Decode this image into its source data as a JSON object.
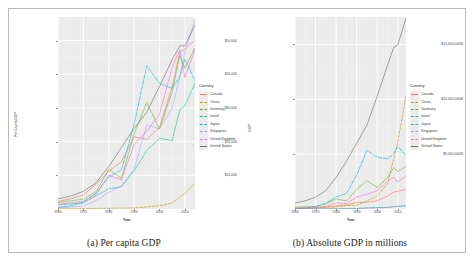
{
  "figure": {
    "panels": [
      {
        "id": "a",
        "caption": "(a) Per capita GDP",
        "ylabel": "PerCapitaGDP",
        "xlabel": "Year",
        "legend_title": "Country"
      },
      {
        "id": "b",
        "caption": "(b) Absolute GDP in millions",
        "ylabel": "GDP",
        "xlabel": "Year",
        "legend_title": "Country"
      }
    ]
  },
  "countries": [
    {
      "name": "Canada",
      "color": "#F8766D"
    },
    {
      "name": "China",
      "color": "#C49A00"
    },
    {
      "name": "Germany",
      "color": "#53B400"
    },
    {
      "name": "Israel",
      "color": "#00C094"
    },
    {
      "name": "Japan",
      "color": "#00B6EB"
    },
    {
      "name": "Singapore",
      "color": "#A58AFF"
    },
    {
      "name": "United Kingdom",
      "color": "#FB61D7"
    },
    {
      "name": "United States",
      "color": "#6E6E6E"
    }
  ],
  "chart_data": [
    {
      "type": "line",
      "panel": "a",
      "title": "(a) Per capita GDP",
      "xlabel": "Year",
      "ylabel": "PerCapitaGDP",
      "xlim": [
        1960,
        2014
      ],
      "ylim": [
        0,
        57000
      ],
      "xticks": [
        1960,
        1970,
        1980,
        1990,
        2000,
        2010
      ],
      "xticklabels": [
        "1960",
        "1970",
        "1980",
        "1990",
        "2000",
        "2010"
      ],
      "yticks": [
        10000,
        20000,
        30000,
        40000,
        50000
      ],
      "yticklabels": [
        "$10,000",
        "$20,000",
        "$30,000",
        "$40,000",
        "$50,000"
      ],
      "grid": true,
      "legend_position": "right",
      "legend_title": "Country",
      "x": [
        1960,
        1965,
        1970,
        1975,
        1980,
        1985,
        1990,
        1995,
        2000,
        2005,
        2008,
        2010,
        2014
      ],
      "series": [
        {
          "name": "Canada",
          "values": [
            2294,
            3000,
            4122,
            7365,
            11169,
            14085,
            21448,
            20700,
            24190,
            36266,
            46594,
            47450,
            50231
          ]
        },
        {
          "name": "China",
          "values": [
            89,
            98,
            113,
            178,
            195,
            294,
            318,
            610,
            959,
            1753,
            3471,
            4550,
            7590
          ]
        },
        {
          "name": "Germany",
          "values": [
            1950,
            2400,
            2953,
            5110,
            11746,
            9120,
            22220,
            31659,
            23719,
            34697,
            45613,
            41785,
            47960
          ]
        },
        {
          "name": "Israel",
          "values": [
            1229,
            1500,
            1800,
            3900,
            6000,
            6600,
            11300,
            17400,
            21000,
            20300,
            29500,
            30700,
            37300
          ]
        },
        {
          "name": "Japan",
          "values": [
            479,
            920,
            2038,
            4660,
            9465,
            11585,
            25124,
            42522,
            37300,
            35781,
            39339,
            44508,
            38100
          ]
        },
        {
          "name": "Singapore",
          "values": [
            428,
            550,
            926,
            2500,
            4928,
            6800,
            11862,
            24937,
            23850,
            29870,
            39220,
            46570,
            56280
          ]
        },
        {
          "name": "United Kingdom",
          "values": [
            1380,
            1800,
            2350,
            4300,
            10032,
            8652,
            19095,
            23123,
            28150,
            42030,
            47290,
            39080,
            47420
          ]
        },
        {
          "name": "United States",
          "values": [
            3007,
            3828,
            5234,
            7801,
            12575,
            18270,
            23889,
            28782,
            36330,
            44308,
            48383,
            48468,
            54600
          ]
        }
      ]
    },
    {
      "type": "line",
      "panel": "b",
      "title": "(b) Absolute GDP in millions",
      "xlabel": "Year",
      "ylabel": "GDP",
      "xlim": [
        1960,
        2014
      ],
      "ylim": [
        0,
        17500000
      ],
      "xticks": [
        1960,
        1970,
        1980,
        1990,
        2000,
        2010
      ],
      "xticklabels": [
        "1960",
        "1970",
        "1980",
        "1990",
        "2000",
        "2010"
      ],
      "yticks": [
        5000000,
        10000000,
        15000000
      ],
      "yticklabels": [
        "$5,000,000M",
        "$10,000,000M",
        "$15,000,000M"
      ],
      "grid": true,
      "legend_position": "right",
      "legend_title": "Country",
      "x": [
        1960,
        1965,
        1970,
        1975,
        1980,
        1985,
        1990,
        1995,
        2000,
        2005,
        2008,
        2010,
        2014
      ],
      "series": [
        {
          "name": "Canada",
          "values": [
            41093,
            57000,
            87900,
            173000,
            273900,
            364800,
            593900,
            604000,
            742300,
            1169000,
            1542600,
            1614100,
            1785400
          ]
        },
        {
          "name": "China",
          "values": [
            59716,
            70400,
            92600,
            163700,
            191100,
            309500,
            360900,
            734500,
            1211300,
            2286000,
            4594300,
            6100600,
            10354800
          ]
        },
        {
          "name": "Germany",
          "values": [
            160000,
            200000,
            215800,
            489000,
            919600,
            724000,
            1764900,
            2591800,
            1949900,
            2861400,
            3752400,
            3417100,
            3879000
          ]
        },
        {
          "name": "Israel",
          "values": [
            2599,
            3400,
            5400,
            12300,
            22500,
            26000,
            52500,
            99500,
            132500,
            142500,
            217800,
            233900,
            305700
          ]
        },
        {
          "name": "Japan",
          "values": [
            44307,
            91000,
            212600,
            521500,
            1105400,
            1398800,
            3103700,
            5333900,
            4731200,
            4571900,
            5037900,
            5700100,
            4850400
          ]
        },
        {
          "name": "Singapore",
          "values": [
            705,
            975,
            1900,
            5600,
            11700,
            17800,
            38900,
            87800,
            95800,
            127400,
            192200,
            236400,
            308100
          ]
        },
        {
          "name": "United Kingdom",
          "values": [
            72328,
            100000,
            130700,
            241800,
            564900,
            489600,
            1093200,
            1341800,
            1657800,
            2520700,
            2890600,
            2441200,
            3022800
          ]
        },
        {
          "name": "United States",
          "values": [
            543300,
            743700,
            1073300,
            1684900,
            2862500,
            4346700,
            5979600,
            7664000,
            10284800,
            13093700,
            14718600,
            14964400,
            17393100
          ]
        }
      ]
    }
  ]
}
